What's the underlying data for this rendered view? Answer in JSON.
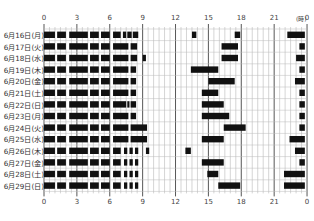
{
  "title": "",
  "unit_label": "(時)",
  "chart_data": {
    "type": "timeline",
    "title": "",
    "xlabel": "",
    "ylabel": "",
    "x_unit": "(時)",
    "xlim": [
      0,
      24
    ],
    "x_ticks": [
      0,
      3,
      6,
      9,
      12,
      15,
      18,
      21,
      24
    ],
    "x_tick_labels": [
      "0",
      "3",
      "6",
      "9",
      "12",
      "15",
      "18",
      "21",
      "0"
    ],
    "grid": true,
    "grid_step_hours": 0.5,
    "bar_color": "#111111",
    "rows": [
      {
        "label": "6月16日(月)",
        "segments": [
          [
            0,
            1
          ],
          [
            1.2,
            2
          ],
          [
            2.3,
            4
          ],
          [
            4.2,
            5
          ],
          [
            5.2,
            6
          ],
          [
            6.3,
            7
          ],
          [
            7.2,
            7.5
          ],
          [
            7.6,
            8
          ],
          [
            8.1,
            8.6
          ],
          [
            13.5,
            13.9
          ],
          [
            17.4,
            17.9
          ],
          [
            22.2,
            23.8
          ]
        ]
      },
      {
        "label": "6月17日(火)",
        "segments": [
          [
            0,
            1
          ],
          [
            1.2,
            2
          ],
          [
            2.3,
            4
          ],
          [
            4.2,
            5
          ],
          [
            5.2,
            6
          ],
          [
            6.3,
            7.7
          ],
          [
            7.9,
            8.5
          ],
          [
            16.2,
            17.7
          ],
          [
            23.3,
            23.8
          ]
        ]
      },
      {
        "label": "6月18日(水)",
        "segments": [
          [
            0,
            1
          ],
          [
            1.2,
            2
          ],
          [
            2.3,
            4
          ],
          [
            4.2,
            5
          ],
          [
            5.2,
            6
          ],
          [
            6.3,
            7.7
          ],
          [
            7.9,
            8.5
          ],
          [
            9.0,
            9.3
          ],
          [
            16.2,
            17.7
          ],
          [
            23.0,
            23.8
          ]
        ]
      },
      {
        "label": "6月19日(木)",
        "segments": [
          [
            0,
            1
          ],
          [
            1.2,
            2
          ],
          [
            2.3,
            4
          ],
          [
            4.2,
            5
          ],
          [
            5.2,
            6
          ],
          [
            6.3,
            7.7
          ],
          [
            7.9,
            8.4
          ],
          [
            13.4,
            15.9
          ],
          [
            23.3,
            23.8
          ]
        ]
      },
      {
        "label": "6月20日(金)",
        "segments": [
          [
            0,
            1
          ],
          [
            1.2,
            2
          ],
          [
            2.3,
            4
          ],
          [
            4.2,
            5
          ],
          [
            5.2,
            6
          ],
          [
            6.3,
            7.7
          ],
          [
            7.9,
            8.4
          ],
          [
            15.0,
            17.4
          ],
          [
            22.9,
            23.8
          ]
        ]
      },
      {
        "label": "6月21日(土)",
        "segments": [
          [
            0,
            1
          ],
          [
            1.2,
            2
          ],
          [
            2.3,
            4
          ],
          [
            4.2,
            5
          ],
          [
            5.2,
            6
          ],
          [
            6.3,
            7.7
          ],
          [
            7.9,
            8.4
          ],
          [
            14.4,
            15.9
          ],
          [
            23.3,
            23.8
          ]
        ]
      },
      {
        "label": "6月22日(日)",
        "segments": [
          [
            0,
            1
          ],
          [
            1.2,
            2
          ],
          [
            2.3,
            4
          ],
          [
            4.2,
            5
          ],
          [
            5.2,
            6
          ],
          [
            6.3,
            7.5
          ],
          [
            7.6,
            7.8
          ],
          [
            7.9,
            8.4
          ],
          [
            14.4,
            16.4
          ],
          [
            23.3,
            23.8
          ]
        ]
      },
      {
        "label": "6月23日(月)",
        "segments": [
          [
            0,
            1
          ],
          [
            1.2,
            2
          ],
          [
            2.3,
            4
          ],
          [
            4.2,
            5
          ],
          [
            5.2,
            6
          ],
          [
            6.3,
            7.7
          ],
          [
            7.9,
            8.4
          ],
          [
            14.4,
            16.9
          ],
          [
            23.3,
            23.8
          ]
        ]
      },
      {
        "label": "6月24日(火)",
        "segments": [
          [
            0,
            1
          ],
          [
            1.2,
            2
          ],
          [
            2.3,
            4
          ],
          [
            4.2,
            5
          ],
          [
            5.2,
            6
          ],
          [
            6.3,
            7.7
          ],
          [
            7.9,
            9.4
          ],
          [
            16.4,
            18.4
          ],
          [
            23.3,
            23.8
          ]
        ]
      },
      {
        "label": "6月25日(水)",
        "segments": [
          [
            0,
            1
          ],
          [
            1.2,
            2
          ],
          [
            2.3,
            4
          ],
          [
            4.2,
            5
          ],
          [
            5.2,
            6
          ],
          [
            6.3,
            7.7
          ],
          [
            7.9,
            9.4
          ],
          [
            14.4,
            16.4
          ],
          [
            22.4,
            23.8
          ]
        ]
      },
      {
        "label": "6月26日(木)",
        "segments": [
          [
            0,
            1
          ],
          [
            1.2,
            2
          ],
          [
            2.3,
            4
          ],
          [
            4.2,
            5
          ],
          [
            5.2,
            6
          ],
          [
            6.3,
            7
          ],
          [
            7.3,
            7.6
          ],
          [
            7.8,
            8.1
          ],
          [
            8.3,
            8.6
          ],
          [
            9.3,
            9.6
          ],
          [
            12.9,
            13.4
          ],
          [
            22.9,
            23.8
          ]
        ]
      },
      {
        "label": "6月27日(金)",
        "segments": [
          [
            0,
            1
          ],
          [
            1.2,
            2
          ],
          [
            2.3,
            4
          ],
          [
            4.2,
            5
          ],
          [
            5.2,
            6
          ],
          [
            6.3,
            7
          ],
          [
            7.3,
            7.6
          ],
          [
            7.8,
            8.1
          ],
          [
            8.3,
            8.6
          ],
          [
            14.4,
            16.4
          ],
          [
            23.3,
            23.8
          ]
        ]
      },
      {
        "label": "6月28日(土)",
        "segments": [
          [
            0,
            1
          ],
          [
            1.2,
            2
          ],
          [
            2.3,
            4
          ],
          [
            4.2,
            5
          ],
          [
            5.2,
            6
          ],
          [
            6.3,
            7
          ],
          [
            7.3,
            7.6
          ],
          [
            7.8,
            8.1
          ],
          [
            8.3,
            8.6
          ],
          [
            14.9,
            15.9
          ],
          [
            21.9,
            23.8
          ]
        ]
      },
      {
        "label": "6月29日(日)",
        "segments": [
          [
            0,
            1
          ],
          [
            1.2,
            2
          ],
          [
            2.3,
            4
          ],
          [
            4.2,
            5
          ],
          [
            5.2,
            6
          ],
          [
            6.3,
            7
          ],
          [
            7.3,
            7.6
          ],
          [
            7.8,
            8.1
          ],
          [
            8.3,
            8.6
          ],
          [
            15.9,
            17.9
          ],
          [
            21.9,
            23.8
          ]
        ]
      }
    ]
  }
}
